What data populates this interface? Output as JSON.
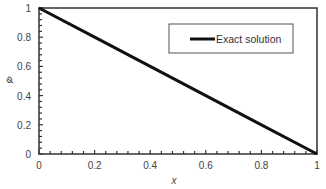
{
  "chart_data": {
    "type": "line",
    "title": "",
    "xlabel": "x",
    "ylabel": "φ",
    "xlim": [
      0,
      1
    ],
    "ylim": [
      0,
      1
    ],
    "x_ticks": [
      "0",
      "0.2",
      "0.4",
      "0.6",
      "0.8",
      "1"
    ],
    "y_ticks": [
      "0",
      "0.2",
      "0.4",
      "0.6",
      "0.8",
      "1"
    ],
    "grid": false,
    "legend_position": "upper right",
    "series": [
      {
        "name": "Exact solution",
        "color": "#111111",
        "x": [
          0,
          0.2,
          0.4,
          0.6,
          0.8,
          1
        ],
        "y": [
          1,
          0.8,
          0.6,
          0.4,
          0.2,
          0
        ]
      }
    ]
  },
  "legend": {
    "items": [
      {
        "label": "Exact solution"
      }
    ]
  },
  "axes": {
    "xlabel": "x",
    "ylabel": "φ"
  }
}
